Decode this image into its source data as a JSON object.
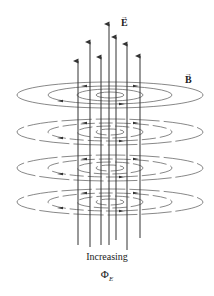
{
  "figure": {
    "labels": {
      "e_field": "E",
      "b_field": "B",
      "vector_arrow": "→",
      "caption": "Increasing",
      "flux_symbol": "Φ",
      "flux_subscript": "E"
    },
    "colors": {
      "lines": "#333333",
      "background": "#ffffff"
    },
    "e_field_lines": [
      {
        "x": 78,
        "top": 57,
        "bottom": 245
      },
      {
        "x": 90,
        "top": 38,
        "bottom": 247
      },
      {
        "x": 101,
        "top": 53,
        "bottom": 245
      },
      {
        "x": 109,
        "top": 20,
        "bottom": 245
      },
      {
        "x": 116,
        "top": 33,
        "bottom": 240
      },
      {
        "x": 127,
        "top": 40,
        "bottom": 250
      },
      {
        "x": 140,
        "top": 52,
        "bottom": 238
      }
    ],
    "b_field_levels": [
      95,
      132,
      168,
      202
    ]
  }
}
